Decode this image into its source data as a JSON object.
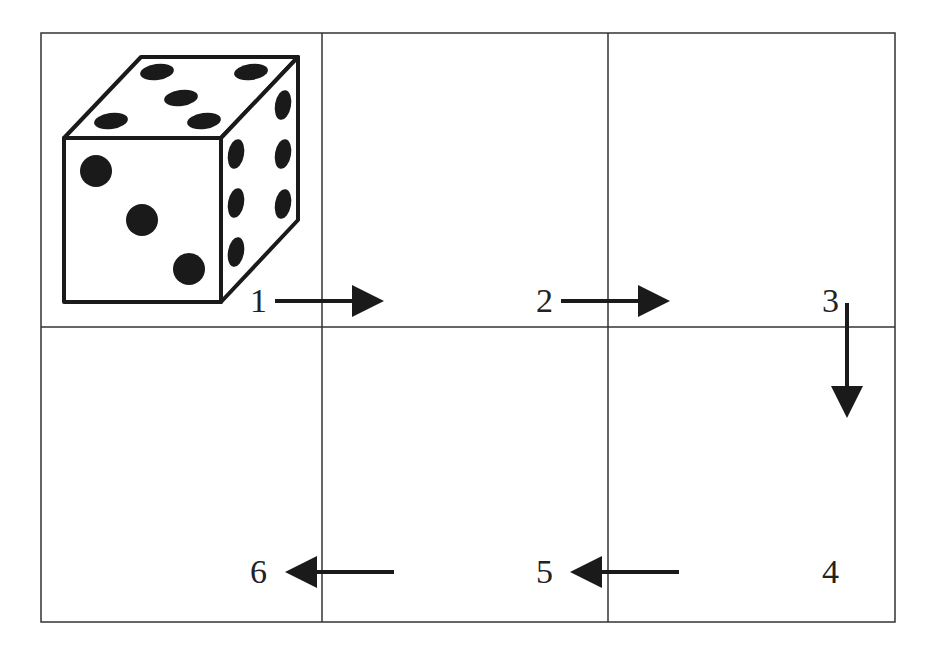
{
  "diagram": {
    "grid": {
      "rows": 2,
      "cols": 3
    },
    "die": {
      "front_face": 3,
      "top_face": 5,
      "right_face": 6
    },
    "labels": [
      {
        "id": "1",
        "text": "1",
        "arrow": "right"
      },
      {
        "id": "2",
        "text": "2",
        "arrow": "right"
      },
      {
        "id": "3",
        "text": "3",
        "arrow": "down"
      },
      {
        "id": "4",
        "text": "4",
        "arrow": "none"
      },
      {
        "id": "5",
        "text": "5",
        "arrow": "left"
      },
      {
        "id": "6",
        "text": "6",
        "arrow": "left"
      }
    ],
    "colors": {
      "line": "#333333",
      "ink": "#1a1a1a",
      "background": "#ffffff"
    }
  }
}
